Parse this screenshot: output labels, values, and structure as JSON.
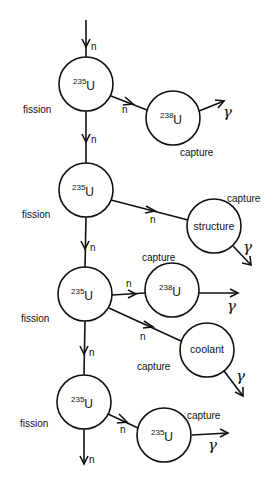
{
  "diagram": {
    "type": "neutron-chain-reaction-flow",
    "neutron_symbol": "n",
    "gamma_symbol": "γ",
    "fission_label": "fission",
    "capture_label": "capture",
    "main_chain": [
      {
        "mass": "235",
        "element": "U",
        "process": "fission"
      },
      {
        "mass": "235",
        "element": "U",
        "process": "fission"
      },
      {
        "mass": "235",
        "element": "U",
        "process": "fission"
      },
      {
        "mass": "235",
        "element": "U",
        "process": "fission"
      }
    ],
    "branches": [
      {
        "from": 0,
        "type": "isotope",
        "mass": "238",
        "element": "U",
        "text": "",
        "process": "capture",
        "emits": "γ"
      },
      {
        "from": 1,
        "type": "material",
        "mass": "",
        "element": "",
        "text": "structure",
        "process": "capture",
        "emits": "γ"
      },
      {
        "from": 2,
        "type": "isotope",
        "mass": "238",
        "element": "U",
        "text": "",
        "process": "capture",
        "emits": "γ"
      },
      {
        "from": 2,
        "type": "material",
        "mass": "",
        "element": "",
        "text": "coolant",
        "process": "capture",
        "emits": "γ"
      },
      {
        "from": 3,
        "type": "isotope",
        "mass": "235",
        "element": "U",
        "text": "",
        "process": "capture",
        "emits": "γ"
      }
    ]
  }
}
